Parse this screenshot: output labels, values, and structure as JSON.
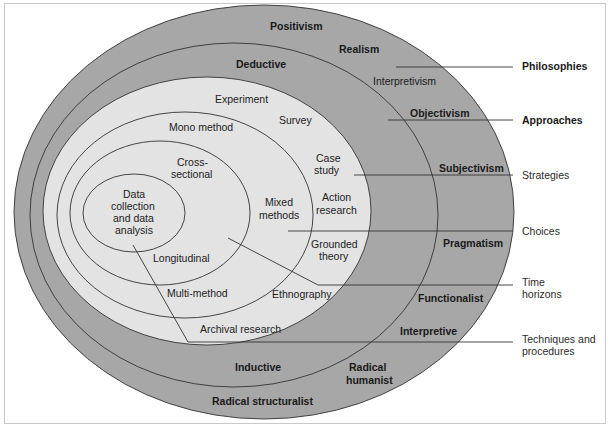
{
  "diagram": {
    "colors": {
      "outer_layer": "#a7a7a7",
      "inner_region": "#e3e3e3",
      "line": "#333333",
      "background": "#ffffff"
    },
    "layers": {
      "philosophies": [
        "Positivism",
        "Realism",
        "Interpretivism",
        "Objectivism",
        "Subjectivism",
        "Pragmatism",
        "Functionalist",
        "Interpretive",
        "Radical humanist",
        "Radical structuralist"
      ],
      "approaches": [
        "Deductive",
        "Inductive"
      ],
      "strategies": [
        "Experiment",
        "Survey",
        "Case",
        "study",
        "Action",
        "research",
        "Grounded",
        "theory",
        "Ethnography",
        "Archival research"
      ],
      "choices": [
        "Mono method",
        "Mixed",
        "methods",
        "Multi-method"
      ],
      "time_horizons": [
        "Cross-",
        "sectional",
        "Longitudinal"
      ],
      "techniques": [
        "Data",
        "collection",
        "and data",
        "analysis"
      ]
    },
    "legend": {
      "philosophies": "Philosophies",
      "approaches": "Approaches",
      "strategies": "Strategies",
      "choices": "Choices",
      "time_horizons_1": "Time",
      "time_horizons_2": "horizons",
      "techniques_1": "Techniques and",
      "techniques_2": "procedures"
    }
  }
}
